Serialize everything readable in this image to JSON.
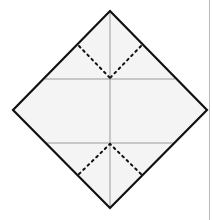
{
  "diagram": {
    "type": "origami-fold-diagram",
    "shape": "square-rotated-45",
    "colors": {
      "outline": "#111111",
      "fill": "#f4f4f4",
      "crease": "#9a9a9a",
      "valley_fold": "#111111",
      "page_edge": "#b8b8b8"
    },
    "vertices": {
      "top": [
        110,
        11
      ],
      "right": [
        207,
        110
      ],
      "bottom": [
        110,
        208
      ],
      "left": [
        13,
        110
      ]
    },
    "creases": [
      {
        "name": "vertical-center",
        "from": [
          110,
          11
        ],
        "to": [
          110,
          208
        ]
      },
      {
        "name": "upper-horizontal",
        "from": [
          45,
          79
        ],
        "to": [
          175,
          79
        ]
      },
      {
        "name": "lower-horizontal",
        "from": [
          45,
          143
        ],
        "to": [
          175,
          143
        ]
      }
    ],
    "dotted_folds": [
      {
        "name": "upper-left",
        "from": [
          79,
          46
        ],
        "to": [
          110,
          78
        ]
      },
      {
        "name": "upper-right",
        "from": [
          141,
          46
        ],
        "to": [
          110,
          78
        ]
      },
      {
        "name": "lower-left",
        "from": [
          79,
          174
        ],
        "to": [
          110,
          144
        ]
      },
      {
        "name": "lower-right",
        "from": [
          141,
          174
        ],
        "to": [
          110,
          144
        ]
      }
    ]
  }
}
